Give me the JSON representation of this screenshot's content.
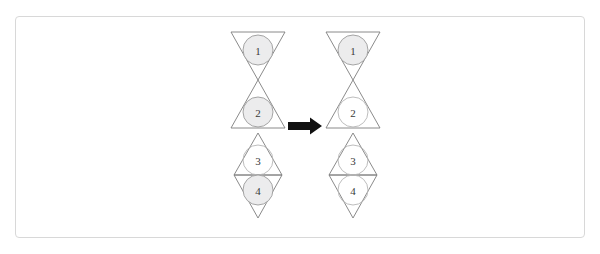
{
  "canvas": {
    "width": 600,
    "height": 254,
    "background_color": "#ffffff"
  },
  "frame": {
    "name": "figure-border",
    "border_color": "#d8d8d8",
    "x": 15,
    "y": 16,
    "width": 570,
    "height": 222
  },
  "colors": {
    "triangle_stroke": "#7d7d7d",
    "circle_stroke": "#9b9b9b",
    "circle_shaded_fill": "#ececed",
    "circle_plain_fill": "#ffffff",
    "label_text": "#3a3a3a",
    "arrow_fill": "#111111"
  },
  "arrow": {
    "name": "transformation-arrow",
    "direction": "right",
    "x": 288,
    "y": 126,
    "length": 34,
    "shaft_thickness": 8,
    "head_width": 12,
    "head_height": 17
  },
  "figures": [
    {
      "id": "left",
      "name": "source-figure",
      "center_x": 258,
      "triangles": [
        {
          "index": 1,
          "orientation": "down",
          "top_y": 32,
          "bottom_y": 80,
          "half_width": 27,
          "circle": {
            "label": "1",
            "cx": 258,
            "cy": 50,
            "r": 15,
            "shaded": true
          }
        },
        {
          "index": 2,
          "orientation": "up",
          "top_y": 80,
          "bottom_y": 128,
          "half_width": 27,
          "circle": {
            "label": "2",
            "cx": 258,
            "cy": 112,
            "r": 15,
            "shaded": true
          }
        },
        {
          "index": 3,
          "orientation": "up",
          "top_y": 133,
          "bottom_y": 175,
          "half_width": 24,
          "circle": {
            "label": "3",
            "cx": 258,
            "cy": 160,
            "r": 15,
            "shaded": false
          }
        },
        {
          "index": 4,
          "orientation": "down",
          "top_y": 175,
          "bottom_y": 218,
          "half_width": 24,
          "circle": {
            "label": "4",
            "cx": 258,
            "cy": 190,
            "r": 15,
            "shaded": true
          }
        }
      ]
    },
    {
      "id": "right",
      "name": "target-figure",
      "center_x": 353,
      "triangles": [
        {
          "index": 1,
          "orientation": "down",
          "top_y": 32,
          "bottom_y": 80,
          "half_width": 27,
          "circle": {
            "label": "1",
            "cx": 353,
            "cy": 50,
            "r": 15,
            "shaded": true
          }
        },
        {
          "index": 2,
          "orientation": "up",
          "top_y": 80,
          "bottom_y": 128,
          "half_width": 27,
          "circle": {
            "label": "2",
            "cx": 353,
            "cy": 112,
            "r": 15,
            "shaded": false
          }
        },
        {
          "index": 3,
          "orientation": "up",
          "top_y": 133,
          "bottom_y": 175,
          "half_width": 24,
          "circle": {
            "label": "3",
            "cx": 353,
            "cy": 160,
            "r": 15,
            "shaded": false
          }
        },
        {
          "index": 4,
          "orientation": "down",
          "top_y": 175,
          "bottom_y": 218,
          "half_width": 24,
          "circle": {
            "label": "4",
            "cx": 353,
            "cy": 190,
            "r": 15,
            "shaded": false
          }
        }
      ]
    }
  ]
}
